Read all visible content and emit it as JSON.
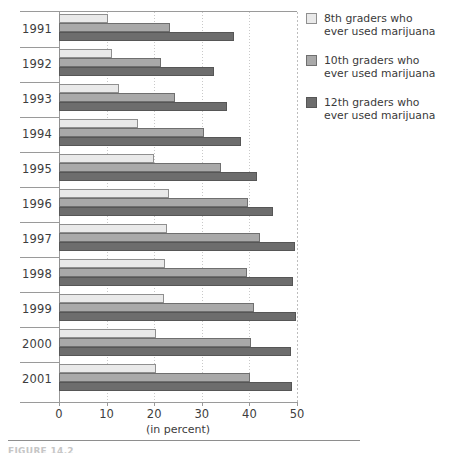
{
  "chart_data": {
    "type": "bar",
    "orientation": "horizontal",
    "title": "",
    "xlabel": "(in percent)",
    "ylabel": "",
    "xlim": [
      0,
      50
    ],
    "xticks": [
      0,
      10,
      20,
      30,
      40,
      50
    ],
    "xtick_labels": [
      "0",
      "10",
      "20",
      "30",
      "40",
      "50"
    ],
    "grid": true,
    "grid_axis": "x",
    "legend_position": "right",
    "categories": [
      "1991",
      "1992",
      "1993",
      "1994",
      "1995",
      "1996",
      "1997",
      "1998",
      "1999",
      "2000",
      "2001"
    ],
    "series": [
      {
        "name": "8th graders who ever used marijuana",
        "color": "#e9e9e9",
        "values": [
          10.2,
          11.2,
          12.6,
          16.7,
          19.9,
          23.1,
          22.6,
          22.2,
          22.0,
          20.3,
          20.4
        ]
      },
      {
        "name": "10th graders who ever used marijuana",
        "color": "#a9a9a9",
        "values": [
          23.4,
          21.4,
          24.4,
          30.4,
          34.1,
          39.8,
          42.3,
          39.6,
          40.9,
          40.3,
          40.1
        ]
      },
      {
        "name": "12th graders who ever used marijuana",
        "color": "#6d6d6d",
        "values": [
          36.7,
          32.6,
          35.3,
          38.2,
          41.7,
          44.9,
          49.6,
          49.1,
          49.7,
          48.8,
          49.0
        ]
      }
    ]
  },
  "axis": {
    "x_title": "(in percent)",
    "tick_labels": [
      "0",
      "10",
      "20",
      "30",
      "40",
      "50"
    ]
  },
  "legend": {
    "items": [
      {
        "swatch": "s0",
        "line1": "8th graders who",
        "line2": "ever used marijuana"
      },
      {
        "swatch": "s1",
        "line1": "10th graders who",
        "line2": "ever used marijuana"
      },
      {
        "swatch": "s2",
        "line1": "12th graders who",
        "line2": "ever used marijuana"
      }
    ]
  },
  "footer": {
    "caption": "FIGURE 14.2"
  }
}
